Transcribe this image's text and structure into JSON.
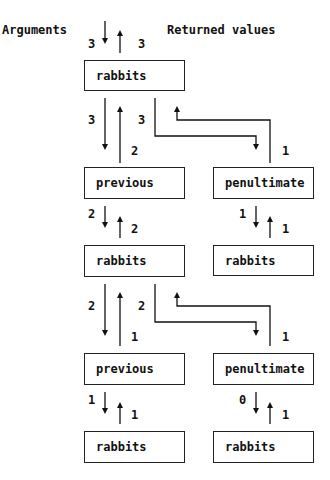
{
  "headers": {
    "arguments": "Arguments",
    "returned_values": "Returned values"
  },
  "boxes": {
    "rabbits_top": "rabbits",
    "previous_1": "previous",
    "penultimate_1": "penultimate",
    "rabbits_2": "rabbits",
    "rabbits_r1": "rabbits",
    "previous_2": "previous",
    "penultimate_2": "penultimate",
    "rabbits_3": "rabbits",
    "rabbits_r2": "rabbits"
  },
  "values": {
    "top_arg": "3",
    "top_ret": "3",
    "r1_to_prev_arg": "3",
    "prev_to_r1_ret": "2",
    "r1_to_pen_arg": "3",
    "pen_to_r1_ret": "1",
    "prev1_to_r2_arg": "2",
    "r2_to_prev1_ret": "2",
    "pen1_to_rr1_arg": "1",
    "rr1_to_pen1_ret": "1",
    "r2_to_prev2_arg": "2",
    "prev2_to_r2_ret": "1",
    "r2_to_pen2_arg": "2",
    "pen2_to_r2_ret": "1",
    "prev2_to_r3_arg": "1",
    "r3_to_prev2_ret": "1",
    "pen2_to_rr2_arg": "0",
    "rr2_to_pen2_ret": "1"
  }
}
